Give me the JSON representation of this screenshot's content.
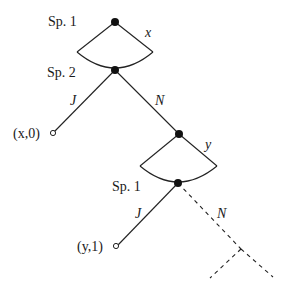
{
  "diagram": {
    "type": "extensive-form game tree",
    "nodes": {
      "root": {
        "label": "Sp. 1",
        "choice_label": "x"
      },
      "n2": {
        "label": "Sp. 2"
      },
      "n3": {
        "choice_label": "y"
      },
      "n4": {
        "label": "Sp. 1"
      }
    },
    "edges": {
      "n2_J": "J",
      "n2_N": "N",
      "n4_J": "J",
      "n4_N": "N"
    },
    "payoffs": {
      "p1": "(x,0)",
      "p2": "(y,1)"
    },
    "labels": {
      "sp1_top": "Sp. 1",
      "sp2": "Sp. 2",
      "sp1_bottom": "Sp. 1",
      "x": "x",
      "y": "y",
      "J1": "J",
      "N1": "N",
      "J2": "J",
      "N2": "N"
    }
  }
}
